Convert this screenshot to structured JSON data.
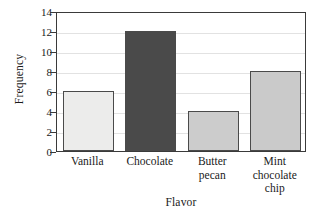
{
  "chart_data": {
    "type": "bar",
    "title": "",
    "subtitle": "",
    "xlabel": "Flavor",
    "ylabel": "Frequency",
    "categories": [
      "Vanilla",
      "Chocolate",
      "Butter\npecan",
      "Mint\nchocolate\nchip"
    ],
    "values": [
      6,
      12,
      4,
      8
    ],
    "bar_colors": [
      "#ececeb",
      "#4a4a4a",
      "#cccccc",
      "#cacaca"
    ],
    "bar_edge_color": "#4a4a4a",
    "ylim": [
      0,
      14
    ],
    "xlim_note": "categorical",
    "yticks": [
      0,
      2,
      4,
      6,
      8,
      10,
      12,
      14
    ],
    "ytick_labels": [
      "0",
      "2",
      "4",
      "6",
      "8",
      "10",
      "12",
      "14"
    ],
    "grid": true,
    "grid_axis": "y",
    "grid_color": "#e2e2e2",
    "legend": false,
    "legend_position": "none",
    "frame_color": "#3a3a3a",
    "background": "#ffffff",
    "annotations": []
  },
  "axes": {
    "y_title": "Frequency",
    "x_title": "Flavor"
  }
}
